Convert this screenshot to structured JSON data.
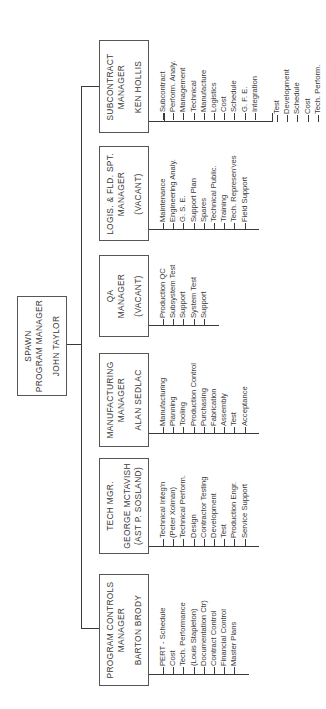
{
  "chart_title": "SPAWN Program Organization",
  "program_manager": {
    "program": "SPAWN",
    "title": "PROGRAM MANAGER",
    "name": "JOHN TAYLOR"
  },
  "departments": [
    {
      "id": "subcontract",
      "title_line1": "SUBCONTRACT",
      "title_line2": "MANAGER",
      "name": "KEN HOLLIS",
      "duties": [
        "Subcontract",
        "Perform. Analy.",
        "Management",
        "Technical",
        "Manufacture",
        "Logistics",
        "Cost",
        "Schedule",
        "G. F. E.",
        "Integration"
      ],
      "duties2": [
        "Test",
        "Development",
        "Schedule",
        "Cost",
        "Tech. Perform."
      ]
    },
    {
      "id": "logistics",
      "title_line1": "LOGIS. & FLD. SPT.",
      "title_line2": "MANAGER",
      "name": "(VACANT)",
      "duties": [
        "Maintenance",
        "Engineering Analy.",
        "G. S. E.",
        "Support Plan",
        "Spares",
        "Technical Public.",
        "Training",
        "Tech. Represen'ves",
        "Field Support"
      ]
    },
    {
      "id": "qa",
      "title_line1": "QA",
      "title_line2": "MANAGER",
      "name": "(VACANT)",
      "duties": [
        "Production QC",
        "Subsystem Test",
        "Support",
        "System Test",
        "Support"
      ]
    },
    {
      "id": "manufacturing",
      "title_line1": "MANUFACTURING",
      "title_line2": "MANAGER",
      "name": "ALAN SEDLAC",
      "duties": [
        "Manufacturing",
        "Planning",
        "Tooling",
        "Production Control",
        "Purchasing",
        "Fabrication",
        "Assembly",
        "Test",
        "Acceptance"
      ]
    },
    {
      "id": "technical",
      "title_line1": "TECH MGR.",
      "title_line2": "GEORGE MCTAVISH",
      "name": "(AST P. SOSLAND)",
      "duties": [
        "Technical Integ'n",
        "(Peter Xolman)",
        "Technical Perform.",
        "Design",
        "Contractor Testing",
        "Development",
        "Test",
        "Production Engr.",
        "Service Support"
      ]
    },
    {
      "id": "program-controls",
      "title_line1": "PROGRAM CONTROLS",
      "title_line2": "MANAGER",
      "name": "BARTON BRODY",
      "duties": [
        "PERT - Schedule",
        "Cost",
        "Tech. Performance",
        "(Louis Stapleton)",
        "Documentation Ctr)",
        "Contract Control",
        "Financial Control",
        "Master Plans"
      ]
    }
  ],
  "colors": {
    "line": "#3a3a3a",
    "text": "#3a3a3a",
    "background": "#ffffff"
  }
}
